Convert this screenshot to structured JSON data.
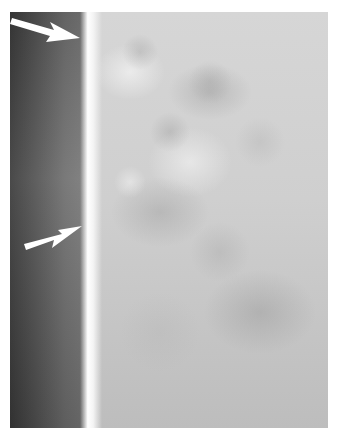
{
  "image": {
    "description": "Grayscale radiograph-style image with a dark strip on the left, a bright vertical edge, and mottled gray texture on the right",
    "annotations": [
      {
        "type": "arrow",
        "color": "#ffffff",
        "direction": "down-right",
        "label": ""
      },
      {
        "type": "arrow",
        "color": "#ffffff",
        "direction": "up-right",
        "label": ""
      }
    ]
  }
}
